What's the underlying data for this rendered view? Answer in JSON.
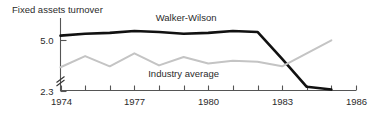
{
  "chart_data": {
    "type": "line",
    "title": "Fixed assets turnover",
    "xlabel": "",
    "ylabel": "Fixed assets turnover",
    "xlim": [
      1974,
      1986
    ],
    "ylim": [
      2.3,
      6.2
    ],
    "grid": false,
    "axis_break": true,
    "legend_position": "inline-annotation",
    "x_ticks": [
      1974,
      1975,
      1976,
      1977,
      1978,
      1979,
      1980,
      1981,
      1982,
      1983,
      1984,
      1985,
      1986
    ],
    "x_tick_labels": [
      "1974",
      "",
      "",
      "1977",
      "",
      "",
      "1980",
      "",
      "",
      "1983",
      "",
      "",
      "1986"
    ],
    "x_tick_labels_shown": [
      "1974",
      "1977",
      "1980",
      "1983",
      "1986"
    ],
    "y_ticks": [
      2.3,
      5.0
    ],
    "y_tick_labels": [
      "2.3",
      "5.0"
    ],
    "series": [
      {
        "name": "Walker-Wilson",
        "color": "#111111",
        "x": [
          1974,
          1975,
          1976,
          1977,
          1978,
          1979,
          1980,
          1981,
          1982,
          1983,
          1984,
          1985
        ],
        "values": [
          5.25,
          5.35,
          5.4,
          5.5,
          5.45,
          5.35,
          5.4,
          5.5,
          5.45,
          4.0,
          2.5,
          2.35
        ]
      },
      {
        "name": "Industry average",
        "color": "#c4c4c4",
        "x": [
          1974,
          1975,
          1976,
          1977,
          1978,
          1979,
          1980,
          1981,
          1982,
          1983,
          1984,
          1985
        ],
        "values": [
          3.55,
          4.15,
          3.6,
          4.3,
          3.65,
          4.1,
          3.75,
          3.9,
          3.85,
          3.6,
          4.3,
          5.0
        ]
      }
    ],
    "annotations": [
      {
        "text": "Walker-Wilson",
        "x": 1979.1,
        "y": 6.05
      },
      {
        "text": "Industry average",
        "x": 1979.0,
        "y": 3.05
      }
    ]
  }
}
